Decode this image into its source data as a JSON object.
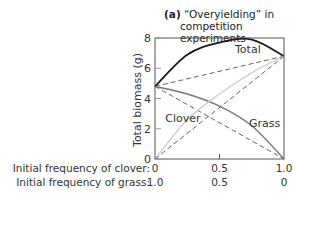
{
  "chart_data": {
    "type": "line",
    "title_prefix": "(a)",
    "title": "“Overyielding” in competition experiments",
    "title_line1": "“Overyielding” in",
    "title_line2": "competition experiments",
    "ylabel": "Total biomass (g)",
    "ylim": [
      0,
      8
    ],
    "yticks": [
      0,
      2,
      4,
      6,
      8
    ],
    "xlim": [
      0,
      1.0
    ],
    "x_axis_rows": [
      {
        "label": "Initial frequency of clover:",
        "ticks": [
          "0",
          "0.5",
          "1.0"
        ]
      },
      {
        "label": "Initial frequency of grass:",
        "ticks": [
          "1.0",
          "0.5",
          "0"
        ]
      }
    ],
    "x": [
      0,
      0.25,
      0.5,
      0.75,
      1.0
    ],
    "series": [
      {
        "name": "Total",
        "style": "solid-black",
        "values": [
          4.8,
          6.9,
          7.7,
          7.9,
          6.8
        ]
      },
      {
        "name": "Total (expected)",
        "style": "dashed",
        "values": [
          4.8,
          5.3,
          5.8,
          6.3,
          6.8
        ]
      },
      {
        "name": "Grass",
        "style": "solid-gray",
        "values": [
          4.8,
          4.3,
          3.5,
          2.2,
          0
        ]
      },
      {
        "name": "Grass (expected)",
        "style": "dashed",
        "values": [
          4.8,
          3.6,
          2.4,
          1.2,
          0
        ]
      },
      {
        "name": "Clover",
        "style": "solid-lightgray",
        "values": [
          0,
          2.6,
          4.3,
          5.7,
          6.8
        ]
      },
      {
        "name": "Clover (expected)",
        "style": "dashed",
        "values": [
          0,
          1.7,
          3.4,
          5.1,
          6.8
        ]
      }
    ],
    "annotations": [
      {
        "text": "Total",
        "x": 0.72,
        "y": 7.3
      },
      {
        "text": "Clover",
        "x": 0.08,
        "y": 2.7
      },
      {
        "text": "Grass",
        "x": 0.85,
        "y": 2.4
      }
    ],
    "grid": false,
    "legend": "none"
  }
}
